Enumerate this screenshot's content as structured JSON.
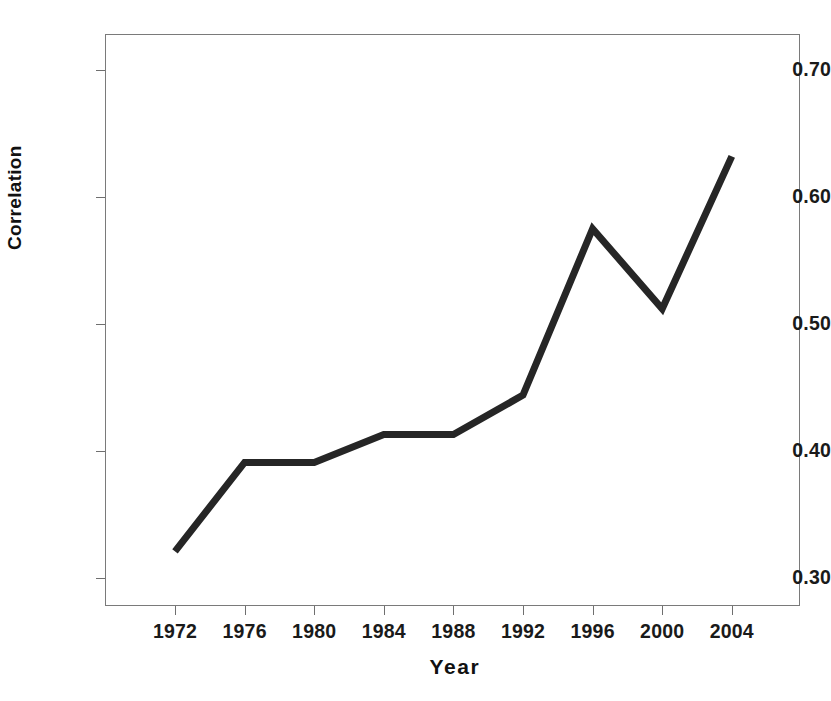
{
  "chart_data": {
    "type": "line",
    "title": "",
    "xlabel": "Year",
    "ylabel": "Correlation",
    "categories": [
      "1972",
      "1976",
      "1980",
      "1984",
      "1988",
      "1992",
      "1996",
      "2000",
      "2004"
    ],
    "x": [
      1972,
      1976,
      1980,
      1984,
      1988,
      1992,
      1996,
      2000,
      2004
    ],
    "values": [
      0.321,
      0.391,
      0.391,
      0.413,
      0.413,
      0.444,
      0.575,
      0.512,
      0.632
    ],
    "series": [
      {
        "name": "Correlation",
        "values": [
          0.321,
          0.391,
          0.391,
          0.413,
          0.413,
          0.444,
          0.575,
          0.512,
          0.632
        ]
      }
    ],
    "xlim": [
      1970,
      2010
    ],
    "ylim": [
      0.28,
      0.725
    ],
    "ytick_labels": [
      "0.30",
      "0.40",
      "0.50",
      "0.60",
      "0.70"
    ],
    "ytick_values": [
      0.3,
      0.4,
      0.5,
      0.6,
      0.7
    ],
    "xtick_labels": [
      "1972",
      "1976",
      "1980",
      "1984",
      "1988",
      "1992",
      "1996",
      "2000",
      "2004"
    ],
    "grid": false,
    "legend": false,
    "legend_position": "none",
    "line_color": "#262626",
    "line_width": 7,
    "frame_color": "#7a7a7a",
    "background_color": "#ffffff"
  }
}
